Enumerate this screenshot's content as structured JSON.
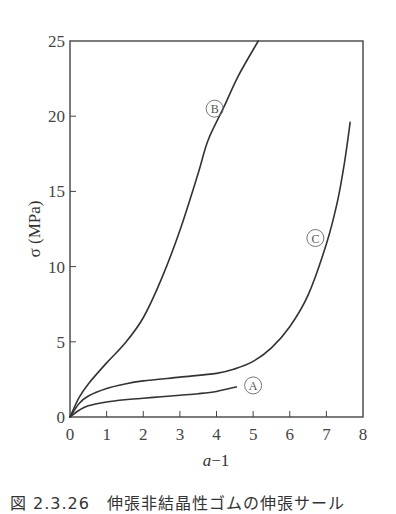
{
  "chart_data": {
    "type": "line",
    "title": "",
    "xlabel": "a−1",
    "ylabel": "σ (MPa)",
    "xlim": [
      0,
      8
    ],
    "ylim": [
      0,
      25
    ],
    "xticks": [
      0,
      1,
      2,
      3,
      4,
      5,
      6,
      7,
      8
    ],
    "yticks": [
      0,
      5,
      10,
      15,
      20,
      25
    ],
    "grid": false,
    "legend": "inline circled labels",
    "series": [
      {
        "name": "Ⓐ",
        "x": [
          0,
          0.25,
          0.5,
          1.0,
          1.5,
          2.0,
          2.5,
          3.0,
          3.5,
          4.0,
          4.54
        ],
        "y": [
          0,
          0.45,
          0.75,
          1.0,
          1.15,
          1.25,
          1.35,
          1.45,
          1.55,
          1.7,
          2.0
        ]
      },
      {
        "name": "Ⓑ",
        "x": [
          0,
          0.25,
          0.5,
          1.0,
          1.5,
          2.0,
          2.5,
          3.0,
          3.5,
          3.77,
          4.2,
          4.6,
          5.14
        ],
        "y": [
          0,
          1.3,
          2.2,
          3.6,
          4.9,
          6.6,
          9.2,
          12.4,
          16.2,
          18.4,
          20.6,
          22.7,
          25.0
        ]
      },
      {
        "name": "Ⓒ",
        "x": [
          0,
          0.25,
          0.5,
          1.0,
          1.5,
          2.0,
          3.0,
          4.0,
          4.5,
          5.0,
          5.5,
          6.0,
          6.5,
          7.0,
          7.3,
          7.5,
          7.65
        ],
        "y": [
          0,
          0.9,
          1.4,
          1.9,
          2.2,
          2.4,
          2.65,
          2.9,
          3.2,
          3.7,
          4.6,
          6.0,
          8.1,
          11.5,
          14.3,
          17.0,
          19.6
        ]
      }
    ],
    "annotations": [
      {
        "text": "Ⓐ",
        "x": 5.0,
        "y": 2.1
      },
      {
        "text": "Ⓑ",
        "x": 3.95,
        "y": 20.5
      },
      {
        "text": "Ⓒ",
        "x": 6.7,
        "y": 11.9
      }
    ]
  },
  "axes": {
    "xlabel": "a−1",
    "ylabel": "σ (MPa)"
  },
  "caption": "図 2.3.26　伸張非結晶性ゴムの伸張サール"
}
